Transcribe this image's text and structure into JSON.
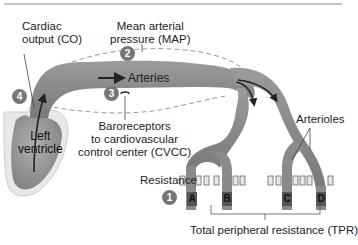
{
  "figure": {
    "labels": {
      "cardiac_output_line1": "Cardiac",
      "cardiac_output_line2": "output (CO)",
      "map_line1": "Mean arterial",
      "map_line2": "pressure (MAP)",
      "arteries": "Arteries",
      "baroreceptors_line1": "Baroreceptors",
      "baroreceptors_line2": "to cardiovascular",
      "baroreceptors_line3": "control center (CVCC)",
      "left_ventricle_line1": "Left",
      "left_ventricle_line2": "ventricle",
      "arterioles": "Arterioles",
      "resistance": "Resistance",
      "tpr": "Total peripheral resistance (TPR)"
    },
    "badges": [
      "1",
      "2",
      "3",
      "4"
    ],
    "vessel_letters": [
      "A",
      "B",
      "C",
      "D"
    ],
    "colors": {
      "vessel": "#8a8a8a",
      "heart_fill": "#9a9a9a",
      "heart_outer": "#e4e4e4",
      "badge": "#777777",
      "text": "#222222",
      "dashed": "#999999"
    }
  }
}
